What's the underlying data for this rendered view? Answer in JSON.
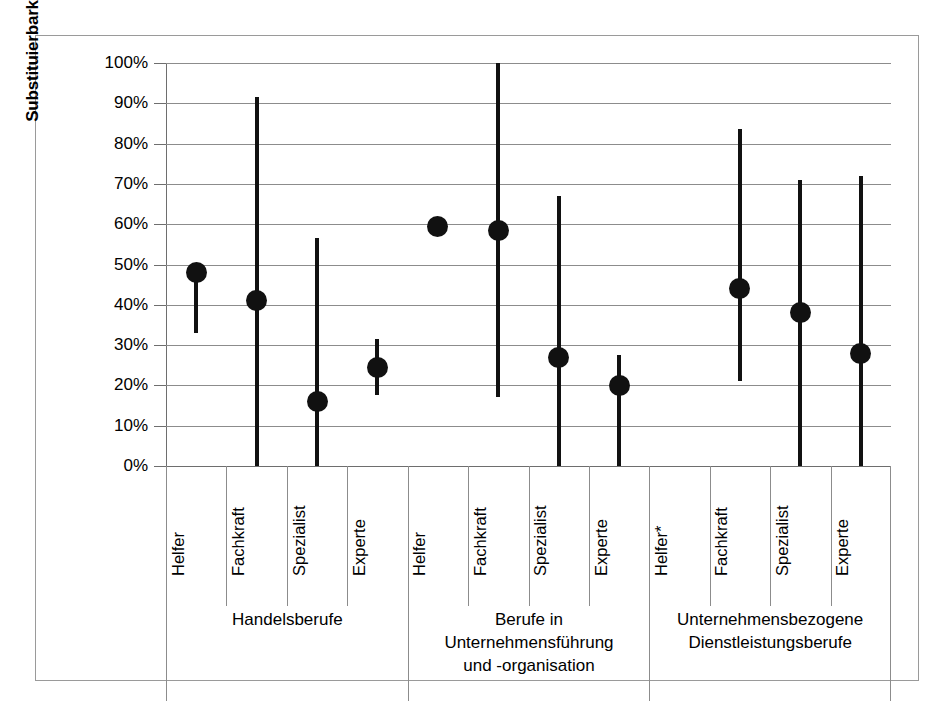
{
  "chart_data": {
    "type": "scatter",
    "title": "",
    "xlabel": "",
    "ylabel": "Substituierbarkeitspotenzial (in %)",
    "ylim": [
      0,
      100
    ],
    "ytick_labels": [
      "100%",
      "90%",
      "80%",
      "70%",
      "60%",
      "50%",
      "40%",
      "30%",
      "20%",
      "10%",
      "0%"
    ],
    "ytick_values": [
      100,
      90,
      80,
      70,
      60,
      50,
      40,
      30,
      20,
      10,
      0
    ],
    "grid": true,
    "legend": "none",
    "categories": [
      "Helfer",
      "Fachkraft",
      "Spezialist",
      "Experte",
      "Helfer",
      "Fachkraft",
      "Spezialist",
      "Experte",
      "Helfer*",
      "Fachkraft",
      "Spezialist",
      "Experte"
    ],
    "groups": [
      {
        "label": "Handelsberufe",
        "span": 4
      },
      {
        "label": "Berufe in\nUnternehmensführung\nund -organisation",
        "span": 4
      },
      {
        "label": "Unternehmensbezogene\nDienstleistungsberufe",
        "span": 4
      }
    ],
    "points": [
      {
        "category": "Helfer",
        "group": "Handelsberufe",
        "value": 48.0,
        "low": 33.0,
        "high": 48.0,
        "has_range": true
      },
      {
        "category": "Fachkraft",
        "group": "Handelsberufe",
        "value": 41.0,
        "low": 0.0,
        "high": 91.5,
        "has_range": true
      },
      {
        "category": "Spezialist",
        "group": "Handelsberufe",
        "value": 16.0,
        "low": 0.0,
        "high": 56.5,
        "has_range": true
      },
      {
        "category": "Experte",
        "group": "Handelsberufe",
        "value": 24.5,
        "low": 17.5,
        "high": 31.5,
        "has_range": true
      },
      {
        "category": "Helfer",
        "group": "Berufe in Unternehmensführung und -organisation",
        "value": 59.5,
        "low": 59.5,
        "high": 59.5,
        "has_range": false
      },
      {
        "category": "Fachkraft",
        "group": "Berufe in Unternehmensführung und -organisation",
        "value": 58.5,
        "low": 17.0,
        "high": 100.0,
        "has_range": true
      },
      {
        "category": "Spezialist",
        "group": "Berufe in Unternehmensführung und -organisation",
        "value": 27.0,
        "low": 0.0,
        "high": 67.0,
        "has_range": true
      },
      {
        "category": "Experte",
        "group": "Berufe in Unternehmensführung und -organisation",
        "value": 20.0,
        "low": 0.0,
        "high": 27.5,
        "has_range": true
      },
      {
        "category": "Helfer*",
        "group": "Unternehmensbezogene Dienstleistungsberufe",
        "value": null,
        "low": null,
        "high": null,
        "has_range": false
      },
      {
        "category": "Fachkraft",
        "group": "Unternehmensbezogene Dienstleistungsberufe",
        "value": 44.0,
        "low": 21.0,
        "high": 83.5,
        "has_range": true
      },
      {
        "category": "Spezialist",
        "group": "Unternehmensbezogene Dienstleistungsberufe",
        "value": 38.0,
        "low": 0.0,
        "high": 71.0,
        "has_range": true
      },
      {
        "category": "Experte",
        "group": "Unternehmensbezogene Dienstleistungsberufe",
        "value": 28.0,
        "low": 0.0,
        "high": 72.0,
        "has_range": true
      }
    ],
    "marker_color": "#111111",
    "grid_color": "#8c8c8c"
  }
}
